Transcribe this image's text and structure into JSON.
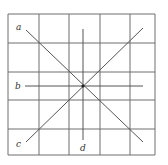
{
  "diagram": {
    "grid": {
      "x_lines": [
        8,
        39,
        69,
        100,
        130,
        155
      ],
      "y_lines": [
        14,
        43,
        72,
        100,
        129,
        155
      ],
      "color": "#6e6e6e"
    },
    "lines": [
      {
        "id": "a",
        "label": "a",
        "x1": 26,
        "y1": 30,
        "x2": 143,
        "y2": 142,
        "label_x": 16,
        "label_y": 30
      },
      {
        "id": "b",
        "label": "b",
        "x1": 25,
        "y1": 86,
        "x2": 143,
        "y2": 86,
        "label_x": 15,
        "label_y": 89
      },
      {
        "id": "c",
        "label": "c",
        "x1": 26,
        "y1": 142,
        "x2": 143,
        "y2": 28,
        "label_x": 16,
        "label_y": 147
      },
      {
        "id": "d",
        "label": "d",
        "x1": 83,
        "y1": 29,
        "x2": 83,
        "y2": 140,
        "label_x": 80,
        "label_y": 151
      }
    ],
    "intersection": {
      "x": 83,
      "y": 86
    },
    "line_color": "#555555"
  }
}
